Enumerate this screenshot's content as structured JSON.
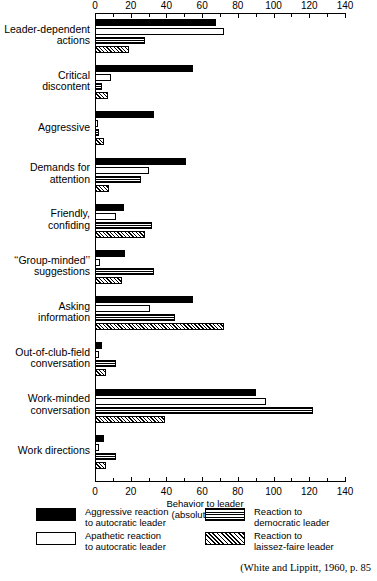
{
  "chart_data": {
    "type": "bar",
    "orientation": "horizontal",
    "title": "",
    "xlabel": "Behavior to leader\n(absolute scale)",
    "ylabel": "",
    "xlim": [
      0,
      140
    ],
    "xticks": [
      0,
      20,
      40,
      60,
      80,
      100,
      120,
      140
    ],
    "minor_tick_step": 10,
    "grid": false,
    "axis_top": true,
    "axis_bottom": true,
    "legend_position": "bottom",
    "categories": [
      "Leader-dependent\nactions",
      "Critical\ndiscontent",
      "Aggressive",
      "Demands for\nattention",
      "Friendly,\nconfiding",
      "‘‘Group-minded’’\nsuggestions",
      "Asking\ninformation",
      "Out-of-club-field\nconversation",
      "Work-minded\nconversation",
      "Work directions"
    ],
    "series": [
      {
        "name": "Aggressive reaction\nto autocratic leader",
        "pattern": "black",
        "values": [
          68,
          55,
          33,
          51,
          16,
          17,
          55,
          4,
          90,
          5
        ]
      },
      {
        "name": "Apathetic reaction\nto autocratic leader",
        "pattern": "white",
        "values": [
          72,
          9,
          1,
          30,
          12,
          3,
          31,
          2,
          96,
          2
        ]
      },
      {
        "name": "Reaction to\ndemocratic leader",
        "pattern": "lines",
        "values": [
          28,
          4,
          2,
          26,
          32,
          33,
          45,
          12,
          122,
          12
        ]
      },
      {
        "name": "Reaction to\nlaissez-faire leader",
        "pattern": "hatch",
        "values": [
          19,
          7,
          5,
          8,
          28,
          15,
          72,
          6,
          39,
          6
        ]
      }
    ]
  },
  "legend": {
    "items": [
      {
        "pattern": "black",
        "label": "Aggressive reaction\nto autocratic leader"
      },
      {
        "pattern": "white",
        "label": "Apathetic reaction\nto autocratic leader"
      },
      {
        "pattern": "lines",
        "label": "Reaction to\ndemocratic leader"
      },
      {
        "pattern": "hatch",
        "label": "Reaction to\nlaissez-faire leader"
      }
    ]
  },
  "source_note": "(White and Lippitt, 1960, p. 85",
  "colors": {
    "ink": "#000000",
    "paper": "#ffffff"
  }
}
